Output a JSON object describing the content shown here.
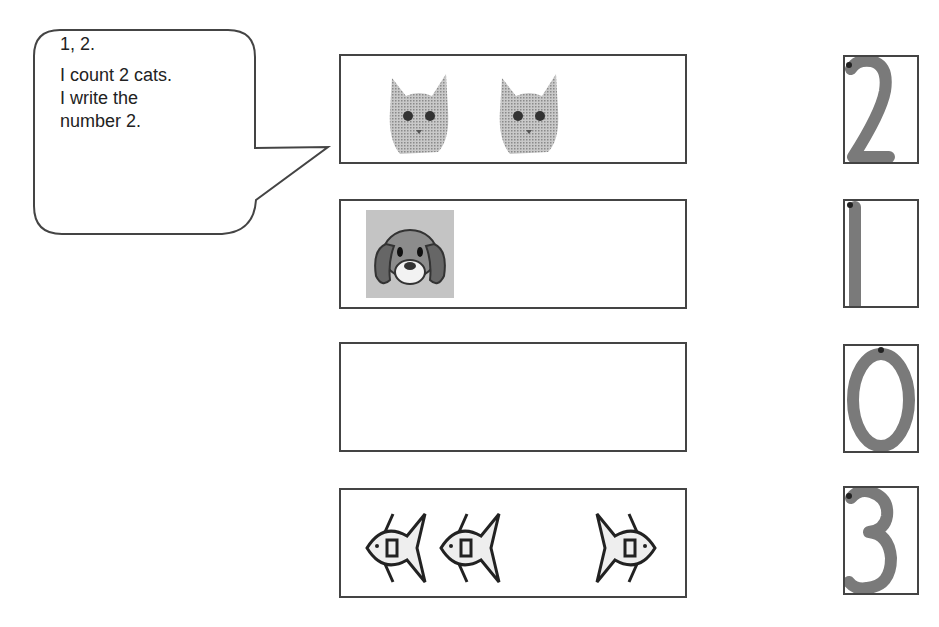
{
  "speech_bubble": {
    "lines": [
      "1, 2.",
      "I count 2 cats.",
      "I write the",
      "number 2."
    ]
  },
  "rows": [
    {
      "animal": "cat",
      "count": 2,
      "icon": "cat-icon",
      "number_label": "2"
    },
    {
      "animal": "dog",
      "count": 1,
      "icon": "dog-icon",
      "number_label": "1"
    },
    {
      "animal": "none",
      "count": 0,
      "icon": "",
      "number_label": "0"
    },
    {
      "animal": "fish",
      "count": 3,
      "icon": "fish-icon",
      "number_label": "3"
    }
  ],
  "colors": {
    "outline": "#444444",
    "number_stroke": "#7a7a7a",
    "start_dot": "#222222"
  }
}
